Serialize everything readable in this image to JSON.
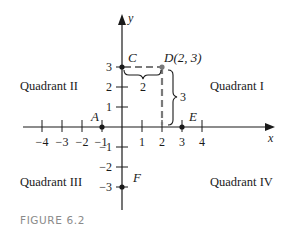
{
  "figure": {
    "caption": "FIGURE 6.2",
    "axes": {
      "x_label": "x",
      "y_label": "y",
      "x_ticks": [
        -4,
        -3,
        -2,
        -1,
        1,
        2,
        3,
        4
      ],
      "x_tick_labels": [
        "−4",
        "−3",
        "−2",
        "−1",
        "1",
        "2",
        "3",
        "4"
      ],
      "y_ticks": [
        3,
        2,
        1,
        -1,
        -2,
        -3
      ],
      "y_tick_labels": [
        "3",
        "2",
        "1",
        "−1",
        "−2",
        "−3"
      ]
    },
    "quadrants": {
      "q1": "Quadrant I",
      "q2": "Quadrant II",
      "q3": "Quadrant III",
      "q4": "Quadrant IV"
    },
    "points": [
      {
        "name": "A",
        "label": "A",
        "x": -1,
        "y": 0
      },
      {
        "name": "C",
        "label": "C",
        "x": 0,
        "y": 3
      },
      {
        "name": "D",
        "label": "D(2, 3)",
        "x": 2,
        "y": 3
      },
      {
        "name": "E",
        "label": "E",
        "x": 3,
        "y": 0
      },
      {
        "name": "F",
        "label": "F",
        "x": 0,
        "y": -3
      }
    ],
    "braces": {
      "horizontal_label": "2",
      "vertical_label": "3"
    },
    "colors": {
      "ink": "#1a1a1a",
      "dashed": "#7a7a7a",
      "caption": "#8a8a8a"
    }
  }
}
